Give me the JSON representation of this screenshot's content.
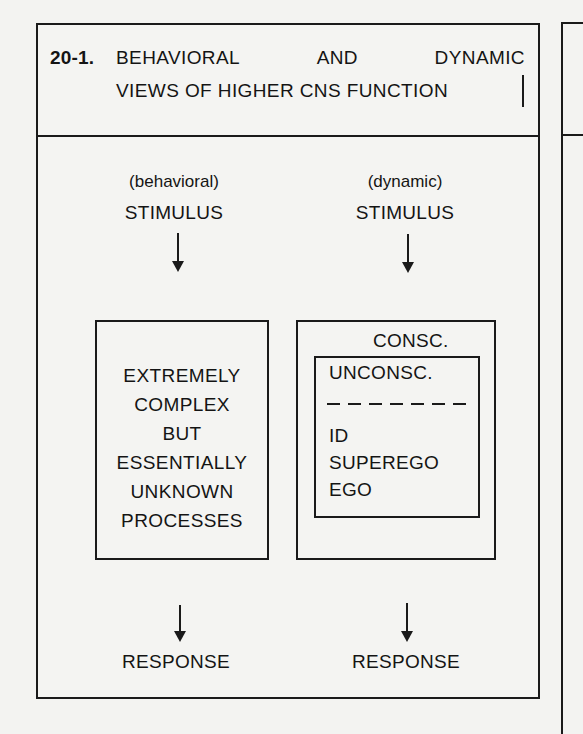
{
  "figure": {
    "number": "20-1.",
    "title_line1_words": [
      "BEHAVIORAL",
      "AND",
      "DYNAMIC"
    ],
    "title_line2": "VIEWS OF HIGHER CNS FUNCTION"
  },
  "behavioral": {
    "label": "(behavioral)",
    "stimulus": "STIMULUS",
    "box_lines": [
      "EXTREMELY",
      "COMPLEX",
      "BUT",
      "ESSENTIALLY",
      "UNKNOWN",
      "PROCESSES"
    ],
    "response": "RESPONSE"
  },
  "dynamic": {
    "label": "(dynamic)",
    "stimulus": "STIMULUS",
    "outer_label": "CONSC.",
    "inner_label": "UNCONSC.",
    "components": [
      "ID",
      "SUPEREGO",
      "EGO"
    ],
    "response": "RESPONSE"
  },
  "colors": {
    "ink": "#1a1a1a",
    "paper": "#f3f3f1"
  }
}
